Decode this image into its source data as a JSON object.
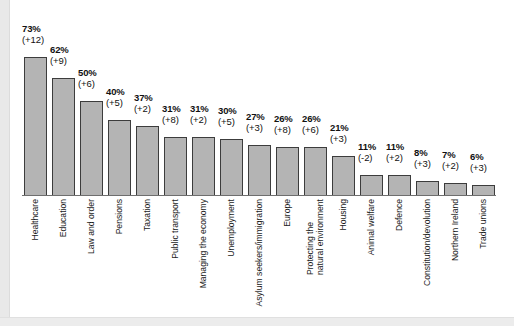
{
  "chart_data": {
    "type": "bar",
    "title": "",
    "subtitle": "",
    "xlabel": "",
    "ylabel": "",
    "ylim": [
      0,
      80
    ],
    "grid": false,
    "legend": "none",
    "value_suffix": "%",
    "categories": [
      "Healthcare",
      "Education",
      "Law and order",
      "Pensions",
      "Taxation",
      "Public transport",
      "Managing the economy",
      "Unemployment",
      "Asylum seekers/immigration",
      "Europe",
      "Protecting the natural environment",
      "Housing",
      "Animal welfare",
      "Defence",
      "Constitution/devolution",
      "Northern Ireland",
      "Trade unions"
    ],
    "values": [
      73,
      62,
      50,
      40,
      37,
      31,
      31,
      30,
      27,
      26,
      26,
      21,
      11,
      11,
      8,
      7,
      6
    ],
    "series": [
      {
        "name": "Percentage",
        "values": [
          73,
          62,
          50,
          40,
          37,
          31,
          31,
          30,
          27,
          26,
          26,
          21,
          11,
          11,
          8,
          7,
          6
        ]
      },
      {
        "name": "Change",
        "values": [
          12,
          9,
          6,
          5,
          2,
          8,
          2,
          5,
          3,
          8,
          6,
          3,
          -2,
          2,
          3,
          2,
          3
        ]
      }
    ],
    "bars": [
      {
        "category": "Healthcare",
        "label_lines": [
          "Healthcare"
        ],
        "value": 73,
        "value_label": "73%",
        "change": 12,
        "change_label": "(+12)"
      },
      {
        "category": "Education",
        "label_lines": [
          "Education"
        ],
        "value": 62,
        "value_label": "62%",
        "change": 9,
        "change_label": "(+9)"
      },
      {
        "category": "Law and order",
        "label_lines": [
          "Law and order"
        ],
        "value": 50,
        "value_label": "50%",
        "change": 6,
        "change_label": "(+6)"
      },
      {
        "category": "Pensions",
        "label_lines": [
          "Pensions"
        ],
        "value": 40,
        "value_label": "40%",
        "change": 5,
        "change_label": "(+5)"
      },
      {
        "category": "Taxation",
        "label_lines": [
          "Taxation"
        ],
        "value": 37,
        "value_label": "37%",
        "change": 2,
        "change_label": "(+2)"
      },
      {
        "category": "Public transport",
        "label_lines": [
          "Public transport"
        ],
        "value": 31,
        "value_label": "31%",
        "change": 8,
        "change_label": "(+8)"
      },
      {
        "category": "Managing the economy",
        "label_lines": [
          "Managing the economy"
        ],
        "value": 31,
        "value_label": "31%",
        "change": 2,
        "change_label": "(+2)"
      },
      {
        "category": "Unemployment",
        "label_lines": [
          "Unemployment"
        ],
        "value": 30,
        "value_label": "30%",
        "change": 5,
        "change_label": "(+5)"
      },
      {
        "category": "Asylum seekers/immigration",
        "label_lines": [
          "Asylum seekers/immigration"
        ],
        "value": 27,
        "value_label": "27%",
        "change": 3,
        "change_label": "(+3)"
      },
      {
        "category": "Europe",
        "label_lines": [
          "Europe"
        ],
        "value": 26,
        "value_label": "26%",
        "change": 8,
        "change_label": "(+8)"
      },
      {
        "category": "Protecting the natural environment",
        "label_lines": [
          "Protecting the",
          "natural environment"
        ],
        "value": 26,
        "value_label": "26%",
        "change": 6,
        "change_label": "(+6)"
      },
      {
        "category": "Housing",
        "label_lines": [
          "Housing"
        ],
        "value": 21,
        "value_label": "21%",
        "change": 3,
        "change_label": "(+3)"
      },
      {
        "category": "Animal welfare",
        "label_lines": [
          "Animal welfare"
        ],
        "value": 11,
        "value_label": "11%",
        "change": -2,
        "change_label": "(-2)"
      },
      {
        "category": "Defence",
        "label_lines": [
          "Defence"
        ],
        "value": 11,
        "value_label": "11%",
        "change": 2,
        "change_label": "(+2)"
      },
      {
        "category": "Constitution/devolution",
        "label_lines": [
          "Constitution/devolution"
        ],
        "value": 8,
        "value_label": "8%",
        "change": 3,
        "change_label": "(+3)"
      },
      {
        "category": "Northern Ireland",
        "label_lines": [
          "Northern Ireland"
        ],
        "value": 7,
        "value_label": "7%",
        "change": 2,
        "change_label": "(+2)"
      },
      {
        "category": "Trade unions",
        "label_lines": [
          "Trade unions"
        ],
        "value": 6,
        "value_label": "6%",
        "change": 3,
        "change_label": "(+3)"
      }
    ],
    "colors": {
      "bar_fill": "#b4b4b4",
      "bar_outline": "#3c3c3c",
      "axis": "#6e6e6e",
      "text": "#111111",
      "background": "#ffffff"
    }
  }
}
